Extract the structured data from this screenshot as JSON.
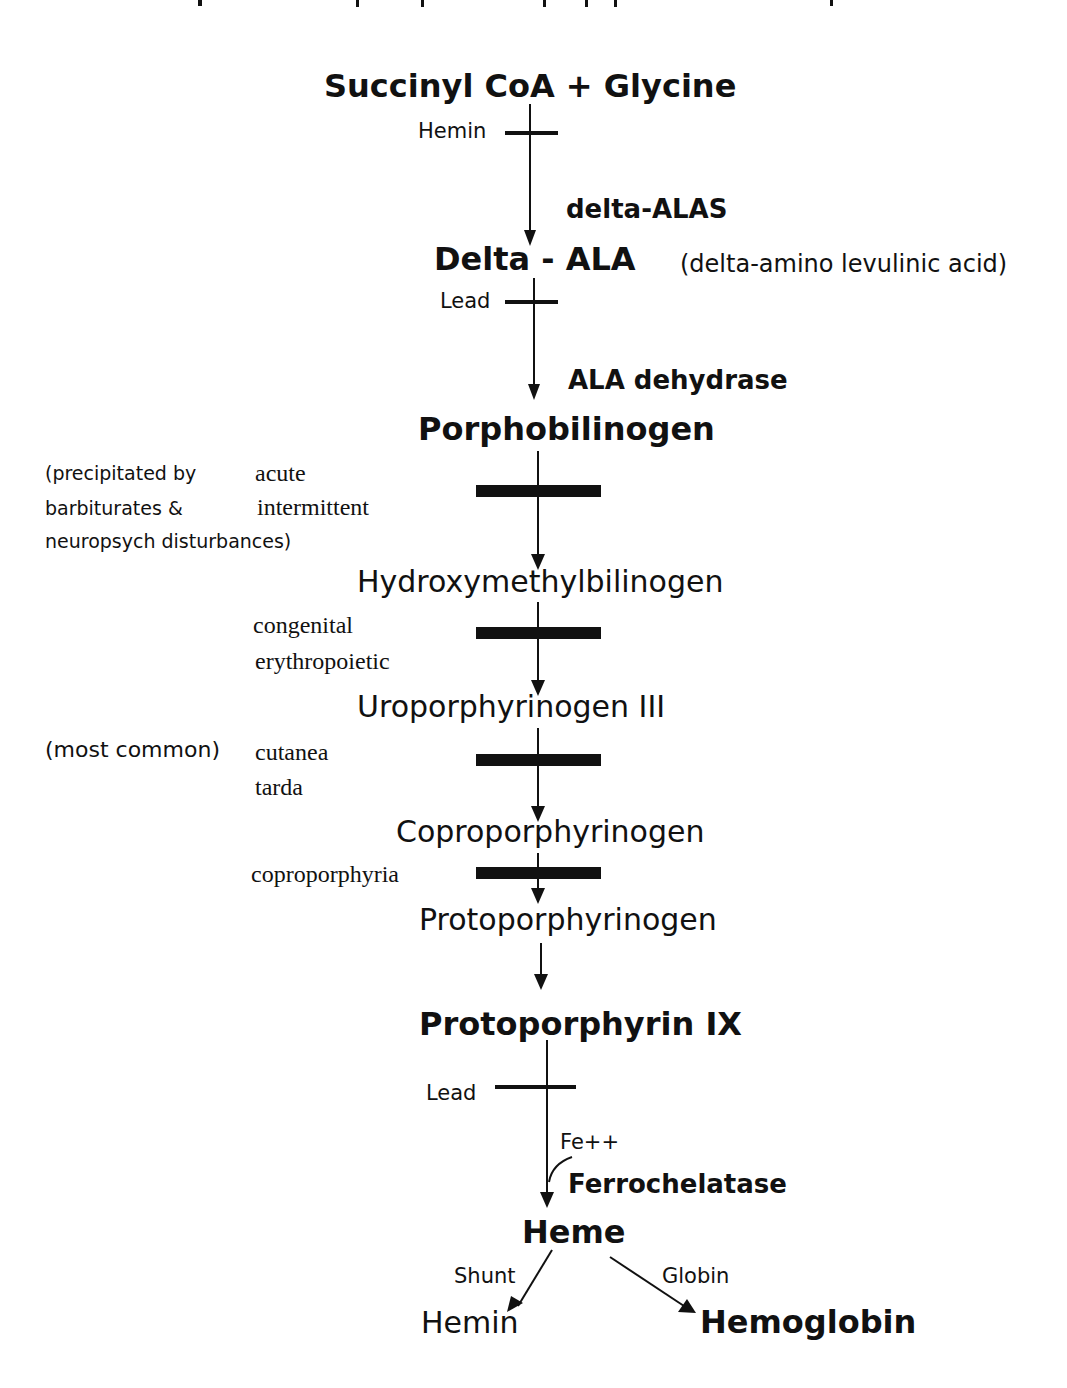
{
  "diagram": {
    "type": "biochemical pathway",
    "clipped_title": "",
    "colors": {
      "ink": "#111111",
      "background": "#ffffff"
    },
    "substrates": {
      "start": "Succinyl CoA + Glycine",
      "delta_ala": "Delta - ALA",
      "delta_ala_expansion": "(delta-amino levulinic acid)",
      "porphobilinogen": "Porphobilinogen",
      "hydroxymethylbilinogen": "Hydroxymethylbilinogen",
      "uroporphyrinogen": "Uroporphyrinogen III",
      "coproporphyrinogen": "Coproporphyrinogen",
      "protoporphyrinogen": "Protoporphyrinogen",
      "protoporphyrin": "Protoporphyrin IX",
      "heme": "Heme",
      "hemin": "Hemin",
      "hemoglobin": "Hemoglobin"
    },
    "enzymes": {
      "alas": "delta-ALAS",
      "ala_dehydrase": "ALA dehydrase",
      "ferrochelatase": "Ferrochelatase",
      "cofactor": "Fe++"
    },
    "inhibitors": {
      "hemin": "Hemin",
      "lead_1": "Lead",
      "lead_2": "Lead"
    },
    "branches": {
      "shunt": "Shunt",
      "globin": "Globin"
    },
    "porphyrias": {
      "aip_line1": "acute",
      "aip_line2": "intermittent",
      "aip_note_line1": "(precipitated by",
      "aip_note_line2": "barbiturates &",
      "aip_note_line3": "neuropsych disturbances)",
      "cep_line1": "congenital",
      "cep_line2": "erythropoietic",
      "pct_note": "(most common)",
      "pct_line1": "cutanea",
      "pct_line2": "tarda",
      "cp": "coproporphyria"
    }
  }
}
